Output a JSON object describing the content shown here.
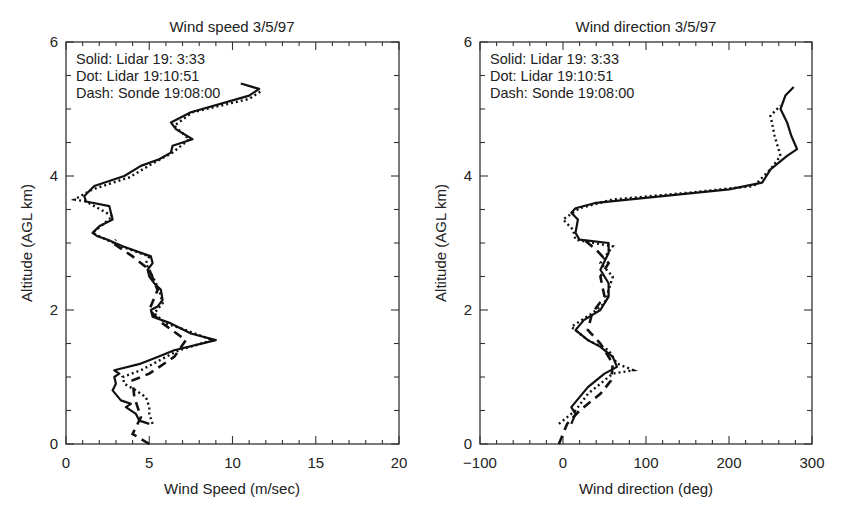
{
  "chart_data": [
    {
      "type": "line",
      "title": "Wind speed 3/5/97",
      "xlabel": "Wind Speed (m/sec)",
      "ylabel": "Altitude (AGL km)",
      "xlim": [
        0,
        20
      ],
      "ylim": [
        0,
        6
      ],
      "xticks": [
        "0",
        "5",
        "10",
        "15",
        "20"
      ],
      "yticks": [
        "0",
        "2",
        "4",
        "6"
      ],
      "grid": false,
      "legend": [
        "Solid: Lidar 19: 3:33",
        "Dot: Lidar 19:10:51",
        "Dash: Sonde 19:08:00"
      ],
      "legend_position": "upper-left",
      "series": [
        {
          "name": "Solid: Lidar 19: 3:33",
          "style": "solid",
          "points": [
            [
              5.0,
              0.3
            ],
            [
              4.4,
              0.35
            ],
            [
              4.2,
              0.45
            ],
            [
              3.6,
              0.55
            ],
            [
              3.9,
              0.6
            ],
            [
              3.3,
              0.65
            ],
            [
              2.8,
              0.8
            ],
            [
              3.0,
              0.9
            ],
            [
              2.9,
              1.0
            ],
            [
              3.2,
              1.05
            ],
            [
              2.9,
              1.1
            ],
            [
              4.5,
              1.2
            ],
            [
              5.5,
              1.3
            ],
            [
              6.5,
              1.4
            ],
            [
              9.0,
              1.55
            ],
            [
              7.5,
              1.65
            ],
            [
              6.3,
              1.8
            ],
            [
              5.2,
              1.9
            ],
            [
              5.1,
              2.0
            ],
            [
              5.5,
              2.05
            ],
            [
              5.8,
              2.15
            ],
            [
              5.7,
              2.3
            ],
            [
              5.3,
              2.4
            ],
            [
              5.0,
              2.5
            ],
            [
              4.9,
              2.6
            ],
            [
              5.2,
              2.7
            ],
            [
              5.1,
              2.8
            ],
            [
              3.4,
              2.95
            ],
            [
              2.5,
              3.05
            ],
            [
              1.9,
              3.1
            ],
            [
              1.6,
              3.15
            ],
            [
              2.0,
              3.25
            ],
            [
              2.8,
              3.35
            ],
            [
              2.6,
              3.55
            ],
            [
              1.2,
              3.62
            ],
            [
              1.1,
              3.7
            ],
            [
              1.7,
              3.85
            ],
            [
              3.5,
              4.0
            ],
            [
              4.5,
              4.15
            ],
            [
              5.6,
              4.25
            ],
            [
              6.3,
              4.35
            ],
            [
              6.4,
              4.45
            ],
            [
              7.6,
              4.55
            ],
            [
              6.6,
              4.7
            ],
            [
              6.3,
              4.8
            ],
            [
              7.5,
              4.95
            ],
            [
              11.0,
              5.2
            ],
            [
              11.6,
              5.3
            ],
            [
              10.5,
              5.38
            ]
          ]
        },
        {
          "name": "Dot: Lidar 19:10:51",
          "style": "dotted",
          "points": [
            [
              5.2,
              0.3
            ],
            [
              5.0,
              0.45
            ],
            [
              5.0,
              0.55
            ],
            [
              4.8,
              0.7
            ],
            [
              4.2,
              0.8
            ],
            [
              3.5,
              0.9
            ],
            [
              3.4,
              1.0
            ],
            [
              4.5,
              1.1
            ],
            [
              6.0,
              1.3
            ],
            [
              6.8,
              1.4
            ],
            [
              8.8,
              1.55
            ],
            [
              7.2,
              1.7
            ],
            [
              6.0,
              1.8
            ],
            [
              5.3,
              1.95
            ],
            [
              5.8,
              2.1
            ],
            [
              5.6,
              2.3
            ],
            [
              5.2,
              2.5
            ],
            [
              4.8,
              2.7
            ],
            [
              5.0,
              2.8
            ],
            [
              3.3,
              2.95
            ],
            [
              2.0,
              3.1
            ],
            [
              1.6,
              3.15
            ],
            [
              2.8,
              3.4
            ],
            [
              1.2,
              3.62
            ],
            [
              0.5,
              3.65
            ],
            [
              1.6,
              3.8
            ],
            [
              3.8,
              3.98
            ],
            [
              5.3,
              4.2
            ],
            [
              6.4,
              4.35
            ],
            [
              7.4,
              4.55
            ],
            [
              6.5,
              4.75
            ],
            [
              7.6,
              4.95
            ],
            [
              11.0,
              5.15
            ],
            [
              11.8,
              5.28
            ]
          ]
        },
        {
          "name": "Dash: Sonde 19:08:00",
          "style": "dashed",
          "points": [
            [
              5.0,
              0.0
            ],
            [
              4.0,
              0.15
            ],
            [
              4.5,
              0.4
            ],
            [
              4.1,
              0.7
            ],
            [
              4.0,
              0.95
            ],
            [
              5.0,
              1.05
            ],
            [
              6.5,
              1.3
            ],
            [
              7.2,
              1.55
            ],
            [
              5.8,
              1.8
            ],
            [
              5.0,
              2.0
            ],
            [
              5.5,
              2.3
            ],
            [
              5.0,
              2.6
            ],
            [
              4.0,
              2.8
            ],
            [
              2.8,
              3.0
            ],
            [
              3.0,
              3.05
            ]
          ]
        }
      ]
    },
    {
      "type": "line",
      "title": "Wind direction 3/5/97",
      "xlabel": "Wind direction (deg)",
      "ylabel": "Altitude (AGL km)",
      "xlim": [
        -100,
        300
      ],
      "ylim": [
        0,
        6
      ],
      "xticks": [
        "−100",
        "0",
        "100",
        "200",
        "300"
      ],
      "yticks": [
        "0",
        "2",
        "4",
        "6"
      ],
      "grid": false,
      "legend": [
        "Solid: Lidar 19: 3:33",
        "Dot: Lidar 19:10:51",
        "Dash: Sonde 19:08:00"
      ],
      "legend_position": "upper-left",
      "series": [
        {
          "name": "Solid: Lidar 19: 3:33",
          "style": "solid",
          "points": [
            [
              10,
              0.3
            ],
            [
              15,
              0.45
            ],
            [
              10,
              0.55
            ],
            [
              20,
              0.7
            ],
            [
              30,
              0.85
            ],
            [
              40,
              0.95
            ],
            [
              50,
              1.05
            ],
            [
              65,
              1.15
            ],
            [
              60,
              1.3
            ],
            [
              45,
              1.45
            ],
            [
              30,
              1.55
            ],
            [
              15,
              1.7
            ],
            [
              25,
              1.85
            ],
            [
              45,
              2.0
            ],
            [
              55,
              2.2
            ],
            [
              55,
              2.4
            ],
            [
              45,
              2.6
            ],
            [
              55,
              2.85
            ],
            [
              55,
              3.0
            ],
            [
              20,
              3.05
            ],
            [
              15,
              3.15
            ],
            [
              18,
              3.35
            ],
            [
              10,
              3.45
            ],
            [
              15,
              3.52
            ],
            [
              40,
              3.6
            ],
            [
              120,
              3.7
            ],
            [
              200,
              3.8
            ],
            [
              240,
              3.9
            ],
            [
              250,
              4.1
            ],
            [
              270,
              4.3
            ],
            [
              282,
              4.4
            ],
            [
              275,
              4.6
            ],
            [
              270,
              4.8
            ],
            [
              262,
              5.0
            ],
            [
              268,
              5.2
            ],
            [
              278,
              5.33
            ]
          ]
        },
        {
          "name": "Dot: Lidar 19:10:51",
          "style": "dotted",
          "points": [
            [
              -5,
              0.3
            ],
            [
              15,
              0.5
            ],
            [
              30,
              0.75
            ],
            [
              50,
              0.95
            ],
            [
              60,
              1.05
            ],
            [
              85,
              1.1
            ],
            [
              65,
              1.2
            ],
            [
              55,
              1.4
            ],
            [
              30,
              1.55
            ],
            [
              10,
              1.75
            ],
            [
              35,
              1.95
            ],
            [
              50,
              2.1
            ],
            [
              60,
              2.5
            ],
            [
              45,
              2.7
            ],
            [
              60,
              2.95
            ],
            [
              15,
              3.05
            ],
            [
              12,
              3.2
            ],
            [
              0,
              3.35
            ],
            [
              20,
              3.52
            ],
            [
              60,
              3.65
            ],
            [
              150,
              3.75
            ],
            [
              230,
              3.85
            ],
            [
              250,
              4.1
            ],
            [
              262,
              4.3
            ],
            [
              255,
              4.6
            ],
            [
              250,
              4.9
            ],
            [
              262,
              5.05
            ]
          ]
        },
        {
          "name": "Dash: Sonde 19:08:00",
          "style": "dashed",
          "points": [
            [
              -5,
              0.0
            ],
            [
              5,
              0.3
            ],
            [
              20,
              0.5
            ],
            [
              45,
              0.75
            ],
            [
              58,
              0.95
            ],
            [
              60,
              1.2
            ],
            [
              45,
              1.5
            ],
            [
              30,
              1.7
            ],
            [
              35,
              1.95
            ],
            [
              50,
              2.2
            ],
            [
              45,
              2.5
            ],
            [
              55,
              2.7
            ],
            [
              40,
              2.9
            ],
            [
              25,
              3.05
            ]
          ]
        }
      ]
    }
  ],
  "labels": {
    "left": {
      "title": "Wind speed 3/5/97",
      "xlabel": "Wind Speed (m/sec)",
      "ylabel": "Altitude (AGL km)",
      "legend": [
        "Solid: Lidar 19: 3:33",
        "Dot: Lidar 19:10:51",
        "Dash: Sonde 19:08:00"
      ]
    },
    "right": {
      "title": "Wind direction 3/5/97",
      "xlabel": "Wind direction (deg)",
      "ylabel": "Altitude (AGL km)",
      "legend": [
        "Solid: Lidar 19: 3:33",
        "Dot: Lidar 19:10:51",
        "Dash: Sonde 19:08:00"
      ]
    }
  }
}
